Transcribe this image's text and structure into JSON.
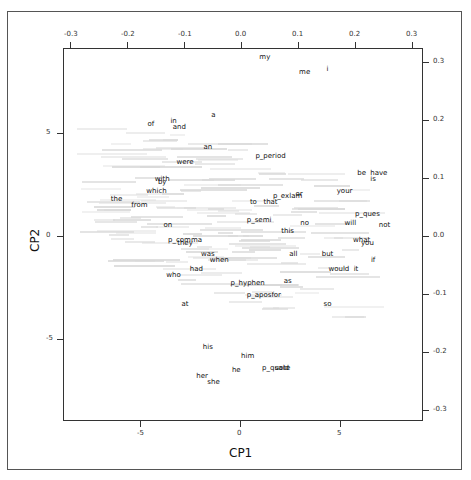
{
  "chart_data": {
    "type": "scatter",
    "subtype": "biplot",
    "title": "",
    "xlabel": "CP1",
    "ylabel": "CP2",
    "xlim": [
      -9.9,
      8.2
    ],
    "ylim": [
      -9.1,
      9.0
    ],
    "x_ticks": [
      -5,
      0,
      5
    ],
    "y_ticks": [
      -5,
      0,
      5
    ],
    "secondary_x_ticks": [
      -0.3,
      -0.2,
      -0.1,
      0.0,
      0.1,
      0.2,
      0.3
    ],
    "secondary_y_ticks": [
      0.3,
      0.2,
      0.1,
      0.0,
      -0.1,
      -0.2,
      -0.3
    ],
    "grid": false,
    "legend": "none",
    "note": "Word loadings plotted on secondary axes; faint grey document labels in background",
    "points": [
      {
        "label": "my",
        "x": 0.04,
        "y": 0.31
      },
      {
        "label": "me",
        "x": 0.11,
        "y": 0.285
      },
      {
        "label": "i",
        "x": 0.15,
        "y": 0.29
      },
      {
        "label": "a",
        "x": -0.05,
        "y": 0.21
      },
      {
        "label": "of",
        "x": -0.16,
        "y": 0.195
      },
      {
        "label": "in",
        "x": -0.12,
        "y": 0.2
      },
      {
        "label": "and",
        "x": -0.11,
        "y": 0.19
      },
      {
        "label": "an",
        "x": -0.06,
        "y": 0.155
      },
      {
        "label": "were",
        "x": -0.1,
        "y": 0.13
      },
      {
        "label": "p_period",
        "x": 0.05,
        "y": 0.14
      },
      {
        "label": "be",
        "x": 0.21,
        "y": 0.11
      },
      {
        "label": "have",
        "x": 0.24,
        "y": 0.11
      },
      {
        "label": "with",
        "x": -0.14,
        "y": 0.1
      },
      {
        "label": "by",
        "x": -0.14,
        "y": 0.095
      },
      {
        "label": "is",
        "x": 0.23,
        "y": 0.1
      },
      {
        "label": "which",
        "x": -0.15,
        "y": 0.08
      },
      {
        "label": "your",
        "x": 0.18,
        "y": 0.08
      },
      {
        "label": "or",
        "x": 0.1,
        "y": 0.075
      },
      {
        "label": "the",
        "x": -0.22,
        "y": 0.065
      },
      {
        "label": "p_exlam",
        "x": 0.08,
        "y": 0.07
      },
      {
        "label": "to",
        "x": 0.02,
        "y": 0.06
      },
      {
        "label": "that",
        "x": 0.05,
        "y": 0.06
      },
      {
        "label": "from",
        "x": -0.18,
        "y": 0.055
      },
      {
        "label": "p_semi",
        "x": 0.03,
        "y": 0.03
      },
      {
        "label": "p_ques",
        "x": 0.22,
        "y": 0.04
      },
      {
        "label": "no",
        "x": 0.11,
        "y": 0.025
      },
      {
        "label": "will",
        "x": 0.19,
        "y": 0.025
      },
      {
        "label": "on",
        "x": -0.13,
        "y": 0.02
      },
      {
        "label": "this",
        "x": 0.08,
        "y": 0.01
      },
      {
        "label": "not",
        "x": 0.25,
        "y": 0.02
      },
      {
        "label": "p_comma",
        "x": -0.1,
        "y": -0.005
      },
      {
        "label": "they",
        "x": -0.1,
        "y": -0.01
      },
      {
        "label": "what",
        "x": 0.21,
        "y": -0.005
      },
      {
        "label": "you",
        "x": 0.22,
        "y": -0.01
      },
      {
        "label": "was",
        "x": -0.06,
        "y": -0.03
      },
      {
        "label": "all",
        "x": 0.09,
        "y": -0.03
      },
      {
        "label": "but",
        "x": 0.15,
        "y": -0.03
      },
      {
        "label": "when",
        "x": -0.04,
        "y": -0.04
      },
      {
        "label": "if",
        "x": 0.23,
        "y": -0.04
      },
      {
        "label": "had",
        "x": -0.08,
        "y": -0.055
      },
      {
        "label": "would",
        "x": 0.17,
        "y": -0.055
      },
      {
        "label": "it",
        "x": 0.2,
        "y": -0.055
      },
      {
        "label": "who",
        "x": -0.12,
        "y": -0.065
      },
      {
        "label": "as",
        "x": 0.08,
        "y": -0.075
      },
      {
        "label": "p_hyphen",
        "x": 0.01,
        "y": -0.08
      },
      {
        "label": "p_apos",
        "x": 0.03,
        "y": -0.1
      },
      {
        "label": "for",
        "x": 0.06,
        "y": -0.1
      },
      {
        "label": "at",
        "x": -0.1,
        "y": -0.115
      },
      {
        "label": "so",
        "x": 0.15,
        "y": -0.115
      },
      {
        "label": "his",
        "x": -0.06,
        "y": -0.19
      },
      {
        "label": "him",
        "x": 0.01,
        "y": -0.205
      },
      {
        "label": "p_quote",
        "x": 0.06,
        "y": -0.225
      },
      {
        "label": "said",
        "x": 0.07,
        "y": -0.225
      },
      {
        "label": "he",
        "x": -0.01,
        "y": -0.23
      },
      {
        "label": "her",
        "x": -0.07,
        "y": -0.24
      },
      {
        "label": "she",
        "x": -0.05,
        "y": -0.25
      }
    ]
  },
  "axes": {
    "x_title": "CP1",
    "y_title": "CP2",
    "bottom_ticks": [
      "-5",
      "0",
      "5"
    ],
    "left_ticks": [
      "5",
      "0",
      "-5"
    ],
    "top_ticks": [
      "-0.3",
      "-0.2",
      "-0.1",
      "0.0",
      "0.1",
      "0.2",
      "0.3"
    ],
    "right_ticks": [
      "0.3",
      "0.2",
      "0.1",
      "0.0",
      "-0.1",
      "-0.2",
      "-0.3"
    ]
  },
  "colors": {
    "word": "#111111",
    "background_labels": "#d9d9d9",
    "axis": "#333333"
  }
}
